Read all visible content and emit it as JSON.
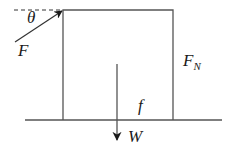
{
  "diagram": {
    "type": "free-body-diagram",
    "colors": {
      "line": "#555555",
      "arrow": "#1a1a1a",
      "text": "#1a1a1a",
      "background": "#ffffff"
    },
    "labels": {
      "angle": "θ",
      "applied_force": "F",
      "normal_force_main": "F",
      "normal_force_sub": "N",
      "friction": "f",
      "weight": "W"
    },
    "elements": {
      "block": {
        "x": 63,
        "y": 10,
        "width": 110,
        "height": 110
      },
      "ground": {
        "x1": 25,
        "x2": 222,
        "y": 120
      },
      "reference_dashed": {
        "x1": 14,
        "x2": 63,
        "y": 10
      },
      "force_F": {
        "from": [
          15,
          42
        ],
        "to": [
          63,
          10
        ]
      },
      "force_FN": {
        "from": [
          173,
          120
        ],
        "to": [
          173,
          50
        ]
      },
      "force_f": {
        "from": [
          173,
          120
        ],
        "to": [
          144,
          120
        ]
      },
      "force_W": {
        "from": [
          117,
          64
        ],
        "to": [
          117,
          140
        ]
      }
    }
  }
}
